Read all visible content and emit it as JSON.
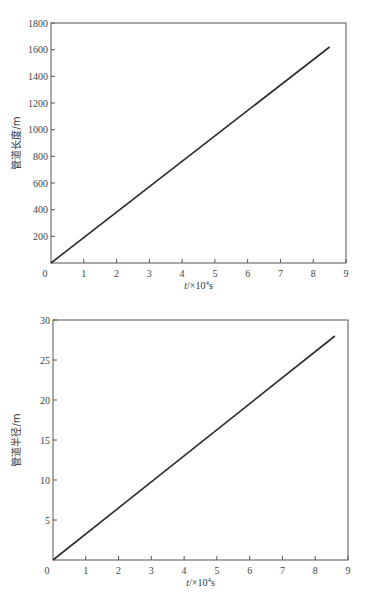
{
  "chart_data": [
    {
      "type": "line",
      "title": "",
      "xlabel": "t/×10⁴s",
      "ylabel": "管道长度/m",
      "xlim": [
        0,
        9
      ],
      "ylim": [
        0,
        1800
      ],
      "x_ticks": [
        0,
        1,
        2,
        3,
        4,
        5,
        6,
        7,
        8,
        9
      ],
      "y_ticks": [
        200,
        400,
        600,
        800,
        1000,
        1200,
        1400,
        1600,
        1800
      ],
      "origin_label": "0",
      "grid": false,
      "legend": null,
      "series": [
        {
          "name": "管道长度",
          "x": [
            0,
            8.5
          ],
          "y": [
            0,
            1620
          ]
        }
      ]
    },
    {
      "type": "line",
      "title": "",
      "xlabel": "t/×10⁴s",
      "ylabel": "管道半径/m",
      "xlim": [
        0,
        9
      ],
      "ylim": [
        0,
        30
      ],
      "x_ticks": [
        0,
        1,
        2,
        3,
        4,
        5,
        6,
        7,
        8,
        9
      ],
      "y_ticks": [
        5,
        10,
        15,
        20,
        25,
        30
      ],
      "origin_label": "0",
      "grid": false,
      "legend": null,
      "series": [
        {
          "name": "管道半径",
          "x": [
            0,
            8.6
          ],
          "y": [
            0,
            28
          ]
        }
      ]
    }
  ],
  "charts": [
    {
      "xlabel_main": "t/×10",
      "xlabel_sup": "4",
      "xlabel_unit": "s",
      "ylabel": "管道长度/m"
    },
    {
      "xlabel_main": "t/×10",
      "xlabel_sup": "4",
      "xlabel_unit": "s",
      "ylabel": "管道半径/m"
    }
  ],
  "style": {
    "line_color": "#2b2b2b",
    "frame_color": "#555555"
  }
}
